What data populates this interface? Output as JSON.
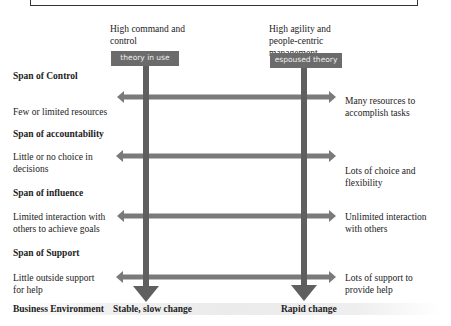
{
  "diagram": {
    "columns": [
      {
        "title": "High command and control",
        "box_label": "theory in use"
      },
      {
        "title": "High agility and people-centric management",
        "box_label": "espoused theory"
      }
    ],
    "rows": [
      {
        "heading": "Span of Control",
        "left": "Few or limited resources",
        "right": "Many resources to accomplish tasks"
      },
      {
        "heading": "Span of accountability",
        "left": "Little or no choice in decisions",
        "right": "Lots of choice and flexibility"
      },
      {
        "heading": "Span of influence",
        "left": "Limited interaction with others to achieve goals",
        "right": "Unlimited interaction with others"
      },
      {
        "heading": "Span of Support",
        "left": "Little outside support for help",
        "right": "Lots of support to provide help"
      }
    ],
    "bottom": {
      "label": "Business Environment",
      "left_value": "Stable, slow change",
      "right_value": "Rapid change"
    },
    "colors": {
      "arrow": "#6e6e6e",
      "box": "#6b6b6b",
      "box_text": "#eeeeee"
    }
  }
}
